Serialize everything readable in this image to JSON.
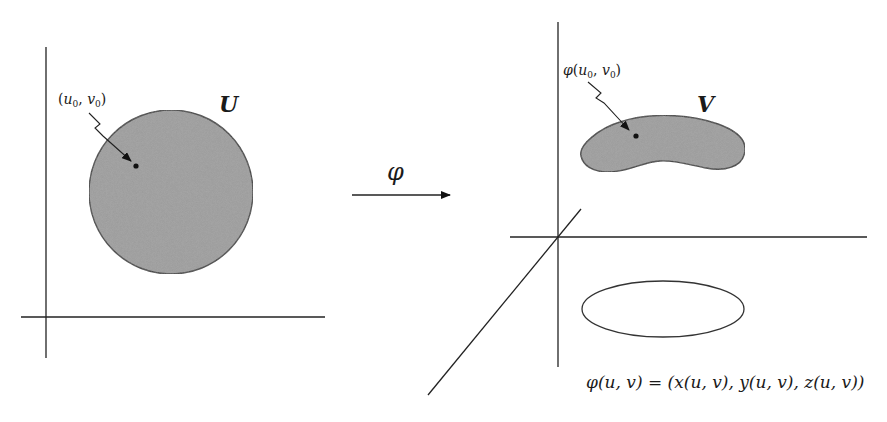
{
  "diagram": {
    "type": "parametrization-map",
    "left_panel": {
      "domain_label": "U",
      "point_label": {
        "open": "(",
        "u": "u",
        "u_sub": "0",
        "comma": ", ",
        "v": "v",
        "v_sub": "0",
        "close": ")"
      },
      "shape": "disk",
      "fill_color": "#9a9a9a",
      "stroke_color": "#333333"
    },
    "map_arrow": {
      "label": "φ"
    },
    "right_panel": {
      "image_label": "V",
      "point_label": {
        "func": "φ",
        "open": "(",
        "u": "u",
        "u_sub": "0",
        "comma": ", ",
        "v": "v",
        "v_sub": "0",
        "close": ")"
      },
      "shape": "curved-surface-patch",
      "shadow_shape": "ellipse",
      "fill_color": "#9a9a9a",
      "stroke_color": "#333333",
      "axes": "3d"
    },
    "formula": "φ(u, v) = (x(u, v), y(u, v), z(u, v))"
  }
}
